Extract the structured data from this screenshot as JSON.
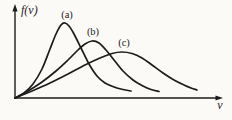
{
  "figure": {
    "background": "#fbfaf7",
    "stroke_color": "#1c1c1c",
    "label_color": "#1c1c1c"
  },
  "chart_data": {
    "type": "line",
    "title": "",
    "xlabel": "v",
    "ylabel": "f(v)",
    "grid": "off",
    "axis_ticks": [],
    "legend": "inline labels above each curve peak",
    "coordinate_space": "viewBox 232x120 px, axes origin at [15,98], y increases downward",
    "x_axis": {
      "label": "v",
      "label_pos": [
        220,
        109
      ],
      "line": [
        [
          15,
          98
        ],
        [
          216,
          98
        ]
      ],
      "arrow_tip": [
        223,
        98
      ]
    },
    "y_axis": {
      "label": "f(v)",
      "label_pos": [
        21,
        14
      ],
      "line": [
        [
          15,
          98
        ],
        [
          15,
          10
        ]
      ],
      "arrow_tip": [
        15,
        4
      ]
    },
    "series": [
      {
        "name": "(a)",
        "label_pos": [
          67,
          18
        ],
        "peak": [
          65,
          23
        ],
        "points": [
          [
            15,
            98
          ],
          [
            24,
            93
          ],
          [
            33,
            84
          ],
          [
            42,
            69
          ],
          [
            50,
            49
          ],
          [
            56,
            34
          ],
          [
            61,
            25
          ],
          [
            65,
            23
          ],
          [
            69,
            26
          ],
          [
            74,
            34
          ],
          [
            81,
            48
          ],
          [
            89,
            64
          ],
          [
            97,
            76
          ],
          [
            105,
            83
          ],
          [
            114,
            87
          ],
          [
            123,
            89.5
          ],
          [
            131,
            91
          ]
        ]
      },
      {
        "name": "(b)",
        "label_pos": [
          93,
          35
        ],
        "peak": [
          92,
          41
        ],
        "points": [
          [
            15,
            98
          ],
          [
            28,
            91
          ],
          [
            42,
            82
          ],
          [
            56,
            71
          ],
          [
            68,
            60
          ],
          [
            78,
            50
          ],
          [
            85,
            44
          ],
          [
            92,
            41
          ],
          [
            99,
            43
          ],
          [
            106,
            50
          ],
          [
            114,
            60
          ],
          [
            123,
            71
          ],
          [
            133,
            80
          ],
          [
            143,
            86
          ],
          [
            151,
            89.5
          ],
          [
            159,
            91.5
          ]
        ]
      },
      {
        "name": "(c)",
        "label_pos": [
          124,
          46
        ],
        "peak": [
          122,
          52
        ],
        "points": [
          [
            15,
            98
          ],
          [
            32,
            91
          ],
          [
            50,
            83
          ],
          [
            68,
            74
          ],
          [
            85,
            65
          ],
          [
            100,
            58
          ],
          [
            112,
            53.5
          ],
          [
            122,
            52
          ],
          [
            132,
            53.5
          ],
          [
            142,
            58
          ],
          [
            152,
            65
          ],
          [
            163,
            73
          ],
          [
            174,
            80
          ],
          [
            184,
            85
          ],
          [
            191,
            88
          ],
          [
            197,
            90
          ]
        ]
      }
    ]
  }
}
